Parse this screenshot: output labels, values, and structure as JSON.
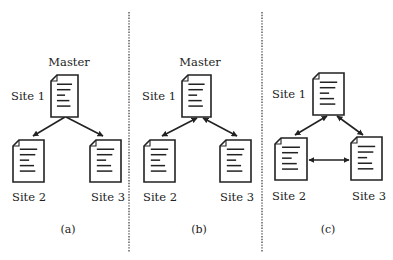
{
  "figure": {
    "background": "#ffffff",
    "ink": "#222222",
    "divider_color": "#555555",
    "dividers": [
      {
        "x": 129,
        "y1": 12,
        "y2": 252
      },
      {
        "x": 262,
        "y1": 12,
        "y2": 252
      }
    ],
    "panels": [
      {
        "id": "a",
        "caption": "(a)",
        "caption_pos": [
          68,
          233
        ],
        "master_label": "Master",
        "master_pos": [
          69,
          66
        ],
        "nodes": [
          {
            "label": "Site 1",
            "doc": [
              51,
              75,
              27,
              42
            ],
            "label_pos": [
              11,
              100
            ],
            "anchor": "start"
          },
          {
            "label": "Site 2",
            "doc": [
              13,
              140,
              31,
              42
            ],
            "label_pos": [
              12,
              201
            ],
            "anchor": "start"
          },
          {
            "label": "Site 3",
            "doc": [
              90,
              140,
              31,
              42
            ],
            "label_pos": [
              91,
              201
            ],
            "anchor": "start"
          }
        ],
        "arrows": [
          {
            "from": [
              65,
              117
            ],
            "to": [
              33,
              136
            ],
            "head_start": false,
            "head_end": true
          },
          {
            "from": [
              66,
              117
            ],
            "to": [
              103,
              136
            ],
            "head_start": false,
            "head_end": true
          }
        ]
      },
      {
        "id": "b",
        "caption": "(b)",
        "caption_pos": [
          199,
          233
        ],
        "master_label": "Master",
        "master_pos": [
          200,
          66
        ],
        "nodes": [
          {
            "label": "Site 1",
            "doc": [
              182,
              75,
              29,
              42
            ],
            "label_pos": [
              142,
              100
            ],
            "anchor": "start"
          },
          {
            "label": "Site 2",
            "doc": [
              144,
              140,
              31,
              42
            ],
            "label_pos": [
              143,
              201
            ],
            "anchor": "start"
          },
          {
            "label": "Site 3",
            "doc": [
              220,
              140,
              31,
              42
            ],
            "label_pos": [
              220,
              201
            ],
            "anchor": "start"
          }
        ],
        "arrows": [
          {
            "from": [
              197,
              118
            ],
            "to": [
              162,
              136
            ],
            "head_start": true,
            "head_end": true
          },
          {
            "from": [
              203,
              118
            ],
            "to": [
              237,
              136
            ],
            "head_start": true,
            "head_end": true
          }
        ]
      },
      {
        "id": "c",
        "caption": "(c)",
        "caption_pos": [
          328,
          233
        ],
        "master_label": "",
        "master_pos": [
          0,
          0
        ],
        "nodes": [
          {
            "label": "Site 1",
            "doc": [
              313,
              73,
              31,
              42
            ],
            "label_pos": [
              272,
              98
            ],
            "anchor": "start"
          },
          {
            "label": "Site 2",
            "doc": [
              275,
              138,
              32,
              42
            ],
            "label_pos": [
              272,
              200
            ],
            "anchor": "start"
          },
          {
            "label": "Site 3",
            "doc": [
              351,
              137,
              31,
              43
            ],
            "label_pos": [
              352,
              200
            ],
            "anchor": "start"
          }
        ],
        "arrows": [
          {
            "from": [
              327,
              116
            ],
            "to": [
              295,
              135
            ],
            "head_start": true,
            "head_end": true
          },
          {
            "from": [
              337,
              116
            ],
            "to": [
              363,
              135
            ],
            "head_start": true,
            "head_end": true
          },
          {
            "from": [
              309,
              160
            ],
            "to": [
              349,
              160
            ],
            "head_start": true,
            "head_end": true
          }
        ]
      }
    ]
  }
}
